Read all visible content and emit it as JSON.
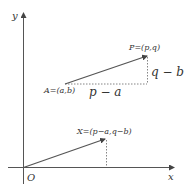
{
  "diagram": {
    "axes": {
      "x_label": "x",
      "y_label": "y",
      "origin_label": "O"
    },
    "points": {
      "A": {
        "label": "A=(a,b)"
      },
      "P": {
        "label": "P=(p,q)"
      },
      "X": {
        "label": "X=(p−a,q−b)"
      }
    },
    "differences": {
      "horizontal": "p − a",
      "vertical": "q − b"
    },
    "colors": {
      "axis": "#555555",
      "vector": "#555555",
      "dotted": "#666666"
    }
  }
}
